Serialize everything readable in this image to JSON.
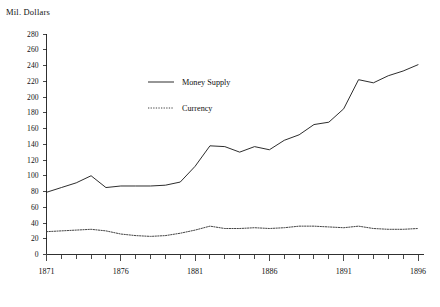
{
  "chart_data": {
    "type": "line",
    "title": "",
    "ylabel": "Mil. Dollars",
    "xlabel": "",
    "x": [
      1871,
      1872,
      1873,
      1874,
      1875,
      1876,
      1877,
      1878,
      1879,
      1880,
      1881,
      1882,
      1883,
      1884,
      1885,
      1886,
      1887,
      1888,
      1889,
      1890,
      1891,
      1892,
      1893,
      1894,
      1895,
      1896
    ],
    "xlim": [
      1871,
      1896
    ],
    "ylim": [
      0,
      280
    ],
    "ytick_labels": [
      "0",
      "20",
      "40",
      "60",
      "80",
      "100",
      "120",
      "140",
      "160",
      "180",
      "200",
      "220",
      "240",
      "260",
      "280"
    ],
    "ytick_values": [
      0,
      20,
      40,
      60,
      80,
      100,
      120,
      140,
      160,
      180,
      200,
      220,
      240,
      260,
      280
    ],
    "xtick_labels": [
      "1871",
      "1876",
      "1881",
      "1886",
      "1891",
      "1896"
    ],
    "xtick_values": [
      1871,
      1876,
      1881,
      1886,
      1891,
      1896
    ],
    "xtick_minor_step": 1,
    "grid": false,
    "legend_position": "upper-left-inside",
    "series": [
      {
        "name": "Money Supply",
        "style": "solid",
        "color": "#222222",
        "values": [
          79,
          85,
          91,
          100,
          85,
          87,
          87,
          87,
          88,
          92,
          112,
          138,
          137,
          130,
          137,
          133,
          145,
          152,
          165,
          168,
          185,
          222,
          218,
          227,
          233,
          241
        ]
      },
      {
        "name": "Currency",
        "style": "dotted",
        "color": "#3a3a3a",
        "values": [
          29,
          30,
          31,
          32,
          30,
          26,
          24,
          23,
          24,
          27,
          31,
          36,
          33,
          33,
          34,
          33,
          34,
          36,
          36,
          35,
          34,
          36,
          33,
          32,
          32,
          33
        ]
      }
    ]
  },
  "legend": {
    "items": [
      {
        "label": "Money Supply",
        "style": "solid"
      },
      {
        "label": "Currency",
        "style": "dotted"
      }
    ]
  }
}
